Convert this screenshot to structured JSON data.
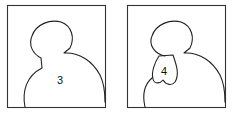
{
  "panels": [
    {
      "id": "panel-3",
      "label": "3",
      "description": "head-and-shoulders silhouette outline"
    },
    {
      "id": "panel-4",
      "label": "4",
      "description": "head-and-shoulders silhouette with bib-shaped region labeled 4 under the chin"
    }
  ],
  "colors": {
    "stroke": "#222222",
    "background": "#ffffff"
  }
}
